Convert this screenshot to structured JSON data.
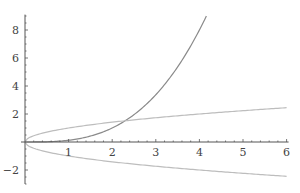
{
  "chart_data": {
    "type": "line",
    "title": "",
    "xlabel": "",
    "ylabel": "",
    "xlim": [
      0,
      6
    ],
    "ylim": [
      -3,
      9
    ],
    "grid": false,
    "legend": null,
    "x_ticks": [
      1,
      2,
      3,
      4,
      5,
      6
    ],
    "x_tick_labels": [
      "1",
      "2",
      "3",
      "4",
      "5",
      "6"
    ],
    "y_ticks": [
      -2,
      2,
      4,
      6,
      8
    ],
    "y_tick_labels": [
      "−2",
      "2",
      "4",
      "6",
      "8"
    ],
    "series": [
      {
        "name": "cubic",
        "description": "approx y = x^3/8, rising steeply, ends near (4.16, 8.7)",
        "color": "#8a8a8a",
        "x": [
          0,
          0.5,
          1,
          1.5,
          2,
          2.5,
          3,
          3.5,
          4,
          4.16
        ],
        "values": [
          0,
          0.02,
          0.13,
          0.42,
          1.0,
          1.95,
          3.38,
          5.36,
          8.0,
          8.7
        ]
      },
      {
        "name": "sqrt",
        "description": "approx y = sqrt(x)",
        "color": "#bdbdbd",
        "x": [
          0,
          0.5,
          1,
          2,
          3,
          4,
          5,
          6
        ],
        "values": [
          0,
          0.71,
          1.0,
          1.41,
          1.73,
          2.0,
          2.24,
          2.45
        ]
      },
      {
        "name": "neg-sqrt",
        "description": "approx y = -sqrt(x)",
        "color": "#bdbdbd",
        "x": [
          0,
          0.5,
          1,
          2,
          3,
          4,
          5,
          6
        ],
        "values": [
          0,
          -0.71,
          -1.0,
          -1.41,
          -1.73,
          -2.0,
          -2.24,
          -2.45
        ]
      }
    ],
    "annotations": []
  },
  "axes": {
    "color": "#555555",
    "origin_px": [
      25,
      142
    ],
    "x_unit_px": 43.6,
    "y_unit_px": 14.0
  }
}
